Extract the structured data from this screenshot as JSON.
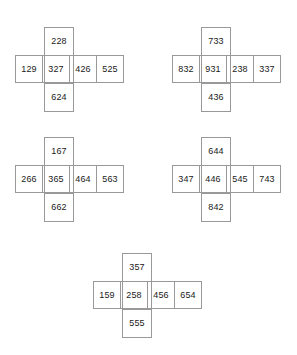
{
  "diagram": {
    "type": "cross-shaped-number-grids",
    "shape_cell_layout": {
      "arms": [
        "top",
        "left",
        "center",
        "right-1",
        "right-2",
        "bottom"
      ],
      "row_cells": 4,
      "vertical_column_index": 2
    },
    "crosses": [
      {
        "id": "cross-1",
        "position": {
          "x": 15,
          "y": 27
        },
        "top": "228",
        "row": [
          "129",
          "327",
          "426",
          "525"
        ],
        "bottom": "624"
      },
      {
        "id": "cross-2",
        "position": {
          "x": 172,
          "y": 27
        },
        "top": "733",
        "row": [
          "832",
          "931",
          "238",
          "337"
        ],
        "bottom": "436"
      },
      {
        "id": "cross-3",
        "position": {
          "x": 15,
          "y": 137
        },
        "top": "167",
        "row": [
          "266",
          "365",
          "464",
          "563"
        ],
        "bottom": "662"
      },
      {
        "id": "cross-4",
        "position": {
          "x": 172,
          "y": 137
        },
        "top": "644",
        "row": [
          "347",
          "446",
          "545",
          "743"
        ],
        "bottom": "842"
      },
      {
        "id": "cross-5",
        "position": {
          "x": 93,
          "y": 253
        },
        "top": "357",
        "row": [
          "159",
          "258",
          "456",
          "654"
        ],
        "bottom": "555"
      }
    ],
    "colors": {
      "border": "#999999",
      "text": "#1a1a1a",
      "background": "#ffffff"
    }
  }
}
